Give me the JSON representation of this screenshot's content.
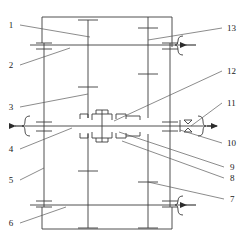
{
  "diagram": {
    "type": "mechanical-schematic",
    "line_color": "#3c3c3c",
    "text_color": "#1a1a1a",
    "background_color": "#ffffff",
    "width": 246,
    "height": 247
  },
  "callouts": {
    "left": [
      {
        "id": "1",
        "label": "1",
        "text_x": 10,
        "text_y": 28,
        "leader": [
          18,
          25,
          88,
          37
        ]
      },
      {
        "id": "2",
        "label": "2",
        "text_x": 10,
        "text_y": 68,
        "leader": [
          18,
          65,
          88,
          49
        ]
      },
      {
        "id": "3",
        "label": "3",
        "text_x": 10,
        "text_y": 110,
        "leader": [
          18,
          107,
          88,
          95
        ]
      },
      {
        "id": "4",
        "label": "4",
        "text_x": 10,
        "text_y": 152,
        "leader": [
          18,
          149,
          72,
          128
        ]
      },
      {
        "id": "5",
        "label": "5",
        "text_x": 10,
        "text_y": 183,
        "leader": [
          18,
          180,
          44,
          168
        ]
      },
      {
        "id": "6",
        "label": "6",
        "text_x": 10,
        "text_y": 226,
        "leader": [
          18,
          223,
          65,
          207
        ]
      }
    ],
    "right": [
      {
        "id": "13",
        "label": "13",
        "text_x": 226,
        "text_y": 31,
        "leader": [
          224,
          28,
          148,
          40
        ]
      },
      {
        "id": "12",
        "label": "12",
        "text_x": 226,
        "text_y": 74,
        "leader": [
          224,
          71,
          115,
          120
        ]
      },
      {
        "id": "11",
        "label": "11",
        "text_x": 226,
        "text_y": 106,
        "leader": [
          224,
          103,
          190,
          128
        ]
      },
      {
        "id": "10",
        "label": "10",
        "text_x": 226,
        "text_y": 146,
        "leader": [
          224,
          143,
          180,
          128
        ]
      },
      {
        "id": "9",
        "label": "9",
        "text_x": 229,
        "text_y": 170,
        "leader": [
          226,
          167,
          118,
          132
        ]
      },
      {
        "id": "8",
        "label": "8",
        "text_x": 229,
        "text_y": 181,
        "leader": [
          226,
          178,
          122,
          140
        ]
      },
      {
        "id": "7",
        "label": "7",
        "text_x": 229,
        "text_y": 202,
        "leader": [
          226,
          199,
          148,
          182
        ]
      }
    ]
  },
  "arrows": {
    "input_left": {
      "name": "left-input-arrow",
      "direction": "left",
      "x": 18,
      "y": 126
    },
    "output_right": {
      "name": "right-output-arrow",
      "direction": "right",
      "x": 215,
      "y": 126
    },
    "brake_top_right": {
      "name": "top-right-brake-arrow",
      "direction": "left",
      "x": 188,
      "y": 45
    },
    "brake_bottom_right": {
      "name": "bottom-right-brake-arrow",
      "direction": "left",
      "x": 188,
      "y": 205
    }
  },
  "shafts": {
    "horizontal_main": {
      "name": "main-horizontal-shaft",
      "y": 126,
      "x1": 25,
      "x2": 212
    },
    "horizontal_upper": {
      "name": "upper-horizontal-shaft",
      "y": 45,
      "x1": 30,
      "x2": 185
    },
    "horizontal_lower": {
      "name": "lower-horizontal-shaft",
      "y": 205,
      "x1": 30,
      "x2": 185
    },
    "vertical_left_outer": {
      "name": "left-outer-vertical-shaft",
      "x": 44,
      "y1": 25,
      "y2": 222
    },
    "vertical_left_inner": {
      "name": "left-inner-vertical-shaft",
      "x": 88,
      "y1": 20,
      "y2": 228
    },
    "vertical_right_inner": {
      "name": "right-inner-vertical-shaft",
      "x": 148,
      "y1": 20,
      "y2": 228
    },
    "vertical_right_outer": {
      "name": "right-outer-vertical-shaft",
      "x": 170,
      "y1": 25,
      "y2": 222
    }
  },
  "housing": {
    "name": "gearbox-housing",
    "x": 42,
    "y": 17,
    "width": 130,
    "height": 212
  }
}
